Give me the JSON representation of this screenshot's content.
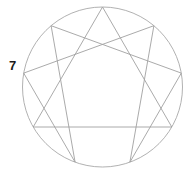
{
  "figure": {
    "name": "enneagram",
    "background_color": "#ffffff",
    "line_color": "#a0a0a0",
    "circle_color": "#a8a8a8",
    "label_color": "#1a1a1a",
    "line_width": 0.9,
    "circle": {
      "center_x": 102.5,
      "center_y": 87,
      "radius": 80
    }
  },
  "labels": [
    {
      "id": "7",
      "text": "7",
      "x": 9,
      "y": 59,
      "bold": true
    }
  ],
  "chart_data": {
    "type": "diagram",
    "points": [
      {
        "number": 9,
        "angle_deg": 0,
        "x": 102.5,
        "y": 7.0
      },
      {
        "number": 1,
        "angle_deg": 40,
        "x": 153.9,
        "y": 25.7
      },
      {
        "number": 2,
        "angle_deg": 80,
        "x": 181.3,
        "y": 73.1
      },
      {
        "number": 3,
        "angle_deg": 120,
        "x": 171.8,
        "y": 127.0
      },
      {
        "number": 4,
        "angle_deg": 160,
        "x": 129.9,
        "y": 162.2
      },
      {
        "number": 5,
        "angle_deg": 200,
        "x": 75.1,
        "y": 162.2
      },
      {
        "number": 6,
        "angle_deg": 240,
        "x": 33.2,
        "y": 127.0
      },
      {
        "number": 7,
        "angle_deg": 280,
        "x": 23.7,
        "y": 73.1
      },
      {
        "number": 8,
        "angle_deg": 320,
        "x": 51.1,
        "y": 25.7
      }
    ],
    "triangle_path": [
      9,
      3,
      6,
      9
    ],
    "hexad_path": [
      1,
      4,
      2,
      8,
      5,
      7,
      1
    ],
    "visible_labels": [
      "7"
    ]
  }
}
